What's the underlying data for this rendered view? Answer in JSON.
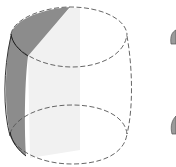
{
  "figure": {
    "colors": {
      "background": "#ffffff",
      "outline": "#333333",
      "dashed": "#555555",
      "dark_strip": "#8c8c8c",
      "light_fill": "#f1f1f1"
    },
    "shapes": [
      {
        "name": "barrel-surface",
        "type": "surface"
      },
      {
        "name": "top-boundary-ellipse",
        "type": "dashed-ellipse"
      },
      {
        "name": "bottom-boundary-ellipse",
        "type": "dashed-ellipse"
      },
      {
        "name": "shaded-strip",
        "type": "filled-region"
      },
      {
        "name": "second-surface-partial",
        "type": "surface-fragment"
      }
    ]
  }
}
